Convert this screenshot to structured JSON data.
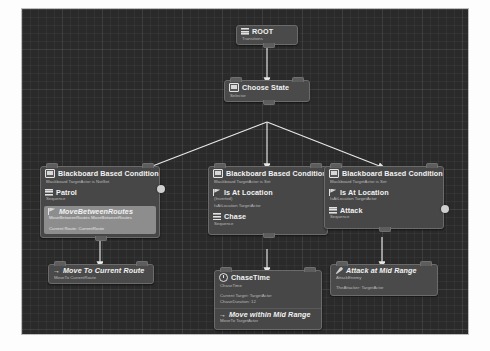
{
  "editor": {
    "name": "behavior-tree-graph",
    "background_color": "#2a2a2a",
    "edge_color": "#e8e8e8",
    "node_color": "#4a4a4a",
    "selected_color": "#8d8d8d"
  },
  "nodes": {
    "root": {
      "title": "ROOT",
      "subtitle": "Transitions",
      "icon": "bars-icon"
    },
    "choose_state": {
      "title": "Choose State",
      "subtitle": "Selector",
      "icon": "monitor-icon"
    },
    "patrol_branch": {
      "decorator": {
        "title": "Blackboard Based Condition",
        "subtitle": "Blackboard TargetActor is NotSet",
        "icon": "monitor-icon"
      },
      "composite": {
        "title": "Patrol",
        "subtitle": "Sequence",
        "icon": "bars-icon"
      },
      "task": {
        "title": "MoveBetweenRoutes",
        "subtitle_1": "MoveBetweenRoutes MoveBetweenRoutes",
        "subtitle_2": "Current Route: CurrentRoute",
        "icon": "flag-icon",
        "selected": true
      }
    },
    "patrol_task": {
      "title": "Move To Current Route",
      "subtitle": "MoveTo CurrentRoute",
      "icon": "arrow-icon"
    },
    "chase_branch": {
      "decorator": {
        "title": "Blackboard Based Condition",
        "subtitle": "Blackboard TargetActor is Set",
        "icon": "monitor-icon"
      },
      "condition": {
        "title": "Is At Location",
        "subtitle_1": "(Inverted)",
        "subtitle_2": "IsAtLocation TargetActor",
        "icon": "flag-icon"
      },
      "composite": {
        "title": "Chase",
        "subtitle": "Sequence",
        "icon": "bars-icon"
      }
    },
    "chase_time": {
      "title": "ChaseTime",
      "subtitle_1": "ChaseTime",
      "subtitle_2": "Current Target: TargetActor",
      "subtitle_3": "ChaseDuration: 12",
      "icon": "clock-icon"
    },
    "chase_move": {
      "title": "Move within Mid Range",
      "subtitle": "MoveTo TargetActor",
      "icon": "arrow-icon"
    },
    "attack_branch": {
      "decorator": {
        "title": "Blackboard Based Condition",
        "subtitle": "Blackboard TargetActor is Set",
        "icon": "monitor-icon"
      },
      "condition": {
        "title": "Is At Location",
        "subtitle": "IsAtLocation TargetActor",
        "icon": "flag-icon"
      },
      "composite": {
        "title": "Attack",
        "subtitle": "Sequence",
        "icon": "bars-icon"
      }
    },
    "attack_task": {
      "title": "Attack at Mid Range",
      "subtitle_1": "AttackEnemy",
      "subtitle_2": "TheAttacker: TargetActor",
      "icon": "sword-icon"
    }
  }
}
